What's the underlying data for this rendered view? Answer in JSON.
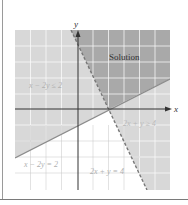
{
  "graph": {
    "axis_x_label": "x",
    "axis_y_label": "y",
    "solution_label": "Solution",
    "inequality_1": "x − 2y ≤ 2",
    "inequality_2": "2x + y ≥ 4",
    "line_1": "x − 2y = 2",
    "line_2": "2x + y = 4",
    "colors": {
      "solution": "#a9a9a9",
      "half_plane": "#d8d8d8",
      "grid": "#ffffff",
      "line": "#8c8c8c",
      "text_light": "#b0b0b0",
      "text_dark": "#333333"
    }
  }
}
